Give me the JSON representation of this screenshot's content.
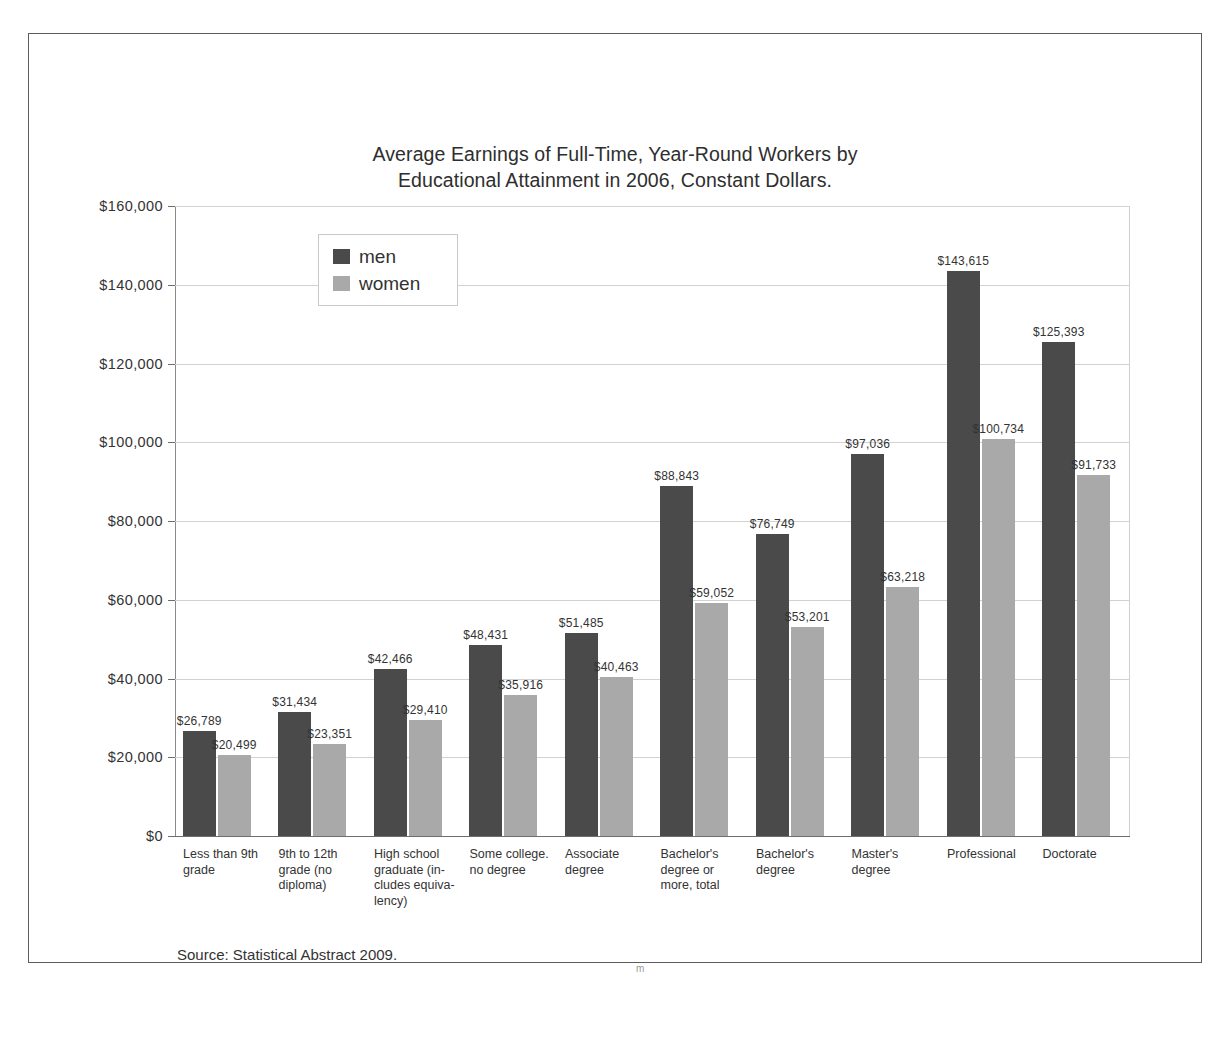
{
  "chart_data": {
    "type": "bar",
    "title": "Average Earnings of Full-Time, Year-Round Workers by Educational Attainment in 2006, Constant Dollars.",
    "title_lines": [
      "Average Earnings of Full-Time, Year-Round Workers by",
      "Educational Attainment in 2006, Constant Dollars."
    ],
    "xlabel": "",
    "ylabel": "",
    "ylim": [
      0,
      160000
    ],
    "grid": true,
    "legend_position": "top-left-inside",
    "source": "Source: Statistical Abstract 2009.",
    "scan_artifact": "m",
    "categories": [
      "Less than 9th grade",
      "9th to 12th grade (no diploma)",
      "High school graduate (includes equivalency)",
      "Some college. no degree",
      "Associate degree",
      "Bachelor's degree or more, total",
      "Bachelor's degree",
      "Master's degree",
      "Professional",
      "Doctorate"
    ],
    "category_label_lines": [
      [
        "Less than 9th",
        "grade"
      ],
      [
        "9th to 12th",
        "grade (no",
        "diploma)"
      ],
      [
        "High school",
        "graduate (in-",
        "cludes equiva-",
        "lency)"
      ],
      [
        "Some college.",
        "no degree"
      ],
      [
        "Associate",
        "degree"
      ],
      [
        "Bachelor's",
        "degree or",
        "more, total"
      ],
      [
        "Bachelor's",
        "degree"
      ],
      [
        "Master's",
        "degree"
      ],
      [
        "Professional"
      ],
      [
        "Doctorate"
      ]
    ],
    "series": [
      {
        "name": "men",
        "color": "#4a4a4a",
        "values": [
          26789,
          31434,
          42466,
          48431,
          51485,
          88843,
          76749,
          97036,
          143615,
          125393
        ],
        "labels": [
          "$26,789",
          "$31,434",
          "$42,466",
          "$48,431",
          "$51,485",
          "$88,843",
          "$76,749",
          "$97,036",
          "$143,615",
          "$125,393"
        ]
      },
      {
        "name": "women",
        "color": "#a9a9a9",
        "values": [
          20499,
          23351,
          29410,
          35916,
          40463,
          59052,
          53201,
          63218,
          100734,
          91733
        ],
        "labels": [
          "$20,499",
          "$23,351",
          "$29,410",
          "$35,916",
          "$40,463",
          "$59,052",
          "$53,201",
          "$63,218",
          "$100,734",
          "$91,733"
        ]
      }
    ],
    "y_ticks": [
      0,
      20000,
      40000,
      60000,
      80000,
      100000,
      120000,
      140000,
      160000
    ],
    "y_tick_labels": [
      "$0",
      "$20,000",
      "$40,000",
      "$60,000",
      "$80,000",
      "$100,000",
      "$120,000",
      "$140,000",
      "$160,000"
    ]
  }
}
